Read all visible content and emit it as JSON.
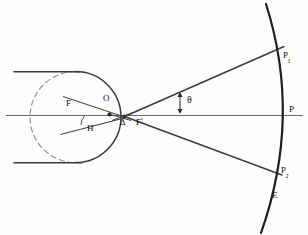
{
  "figure": {
    "type": "optics-ray-diagram",
    "canvas": {
      "width": 308,
      "height": 235
    },
    "background_color": "#fdfdfd",
    "ink_color": "#1a1a1a",
    "axis_color": "#555555"
  },
  "labels": [
    {
      "id": "F",
      "text": "F",
      "sub": "",
      "prime": "",
      "x": 67,
      "y": 104,
      "name": "label-focal-point-F"
    },
    {
      "id": "O",
      "text": "O",
      "sub": "",
      "prime": "",
      "x": 103,
      "y": 99,
      "name": "label-optical-center-O"
    },
    {
      "id": "H",
      "text": "H",
      "sub": "",
      "prime": "",
      "x": 87,
      "y": 128,
      "name": "label-principal-point-H"
    },
    {
      "id": "D",
      "text": "Δ",
      "sub": "",
      "prime": "",
      "x": 121,
      "y": 122,
      "name": "label-vertex-delta"
    },
    {
      "id": "F1",
      "text": "F",
      "sub": "",
      "prime": "'",
      "x": 137,
      "y": 123,
      "name": "label-focal-point-F-prime"
    },
    {
      "id": "TH",
      "text": "θ",
      "sub": "",
      "prime": "",
      "x": 182,
      "y": 99,
      "name": "label-angle-theta"
    },
    {
      "id": "P1",
      "text": "P",
      "sub": "1",
      "prime": "",
      "x": 283,
      "y": 56,
      "name": "label-image-point-P1"
    },
    {
      "id": "P",
      "text": "P",
      "sub": "",
      "prime": "",
      "x": 289,
      "y": 110,
      "name": "label-image-point-P"
    },
    {
      "id": "P2",
      "text": "P",
      "sub": "2",
      "prime": "",
      "x": 282,
      "y": 171,
      "name": "label-image-point-P2"
    },
    {
      "id": "E",
      "text": "E",
      "sub": "",
      "prime": "",
      "x": 272,
      "y": 196,
      "name": "label-image-surface-E"
    }
  ],
  "geometry": {
    "lens_circle": {
      "cx": 75,
      "cy": 117,
      "r": 45,
      "solid_arc": "right-portion",
      "dashed_arc": "left-portion"
    },
    "principal_axis": {
      "x1": 6,
      "y1": 115,
      "x2": 302,
      "y2": 115
    },
    "incident_ray_top": {
      "x1": 14,
      "y1": 72,
      "x2": 78,
      "y2": 72
    },
    "incident_ray_bottom": {
      "x1": 14,
      "y1": 163,
      "x2": 80,
      "y2": 163
    },
    "vertex_point": {
      "x": 124,
      "y": 117
    },
    "optical_center_point": {
      "x": 108,
      "y": 112
    },
    "image_arc": {
      "start": {
        "x": 266,
        "y": 5
      },
      "control": {
        "x": 300,
        "y": 117
      },
      "end": {
        "x": 261,
        "y": 232
      }
    },
    "upper_ray": {
      "x1": 124,
      "y1": 117,
      "x2": 283,
      "y2": 47
    },
    "lower_ray": {
      "x1": 124,
      "y1": 117,
      "x2": 281,
      "y2": 174
    },
    "theta_marker": {
      "x": 180,
      "y_top": 92,
      "y_bottom": 112
    },
    "F_angle_wedge": {
      "apex_x": 124,
      "apex_y": 117,
      "upper_x": 63,
      "upper_y": 97,
      "lower_x": 61,
      "lower_y": 133
    },
    "H_angle_arc": {
      "cx": 83,
      "cy": 123,
      "r": 12
    }
  }
}
